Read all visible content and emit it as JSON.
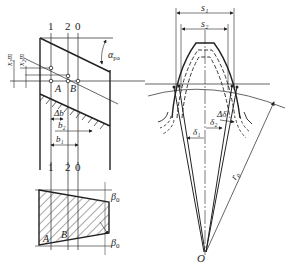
{
  "diagram": {
    "colors": {
      "ink": "#222222",
      "background": "#ffffff"
    },
    "left_top": {
      "section_marks": [
        "1",
        "2",
        "0"
      ],
      "points": [
        "A",
        "B"
      ],
      "dims": {
        "x1m": "x₁m",
        "x2m": "x₂m",
        "alpha": "α",
        "alpha_sub": "pa",
        "delta_b": "Δb",
        "b2": "b₂",
        "b1": "b₁"
      }
    },
    "left_bottom": {
      "section_marks": [
        "1",
        "2",
        "0"
      ],
      "points": [
        "A",
        "B"
      ],
      "beta": "β",
      "beta_sub": "0"
    },
    "right": {
      "s1": "s₁",
      "s2": "s₂",
      "delta_s": "Δδ",
      "delta1": "δ₁",
      "delta2": "δ₂",
      "r0": "r₀",
      "origin": "O"
    }
  }
}
